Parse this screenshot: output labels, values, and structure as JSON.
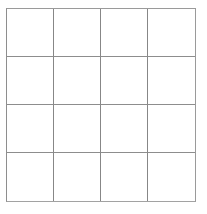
{
  "figure": {
    "name": "empty-grid",
    "background_color": "#ffffff",
    "canvas": {
      "width": 207,
      "height": 214
    }
  },
  "grid": {
    "rows": 4,
    "columns": 4,
    "cell_count": 16,
    "line_color": "#8a8a8a",
    "border_color": "#9a9a9a",
    "cell_fill": "#ffffff",
    "line_width": 1,
    "bounds": {
      "left": 6,
      "top": 8,
      "right": 196,
      "bottom": 202
    },
    "vertical_line_positions": [
      6,
      56,
      104,
      152,
      196
    ],
    "horizontal_line_positions": [
      8,
      58,
      106,
      155,
      202
    ],
    "cells": [
      {
        "row": 1,
        "column": 1,
        "label": ""
      },
      {
        "row": 1,
        "column": 2,
        "label": ""
      },
      {
        "row": 1,
        "column": 3,
        "label": ""
      },
      {
        "row": 1,
        "column": 4,
        "label": ""
      },
      {
        "row": 2,
        "column": 1,
        "label": ""
      },
      {
        "row": 2,
        "column": 2,
        "label": ""
      },
      {
        "row": 2,
        "column": 3,
        "label": ""
      },
      {
        "row": 2,
        "column": 4,
        "label": ""
      },
      {
        "row": 3,
        "column": 1,
        "label": ""
      },
      {
        "row": 3,
        "column": 2,
        "label": ""
      },
      {
        "row": 3,
        "column": 3,
        "label": ""
      },
      {
        "row": 3,
        "column": 4,
        "label": ""
      },
      {
        "row": 4,
        "column": 1,
        "label": ""
      },
      {
        "row": 4,
        "column": 2,
        "label": ""
      },
      {
        "row": 4,
        "column": 3,
        "label": ""
      },
      {
        "row": 4,
        "column": 4,
        "label": ""
      }
    ]
  }
}
